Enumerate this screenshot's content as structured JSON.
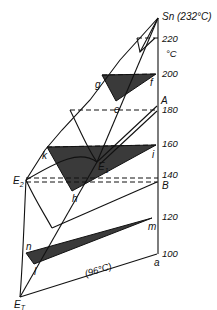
{
  "diagram": {
    "apex_label": "Sn (232°C)",
    "unit_label": "°C",
    "eutectic_temp_label": "(96°C)",
    "colors": {
      "line": "#111111",
      "shade": "#3a3a3a",
      "background": "#ffffff"
    },
    "axis_ticks": [
      {
        "label": "220",
        "value": 220
      },
      {
        "label": "200",
        "value": 200
      },
      {
        "label": "180",
        "value": 180
      },
      {
        "label": "160",
        "value": 160
      },
      {
        "label": "140",
        "value": 140
      },
      {
        "label": "120",
        "value": 120
      },
      {
        "label": "100",
        "value": 100
      }
    ],
    "points": {
      "A": "A",
      "B": "B",
      "a": "a",
      "g": "g",
      "f": "f",
      "e": "e",
      "k": "k",
      "i": "i",
      "E1": "E",
      "E1_sub": "1",
      "h": "h",
      "E2": "E",
      "E2_sub": "2",
      "n": "n",
      "l": "l",
      "m": "m",
      "ET": "E",
      "ET_sub": "T"
    },
    "tie_triangles": [
      {
        "name": "g-e-f",
        "temperature": 200
      },
      {
        "name": "k-h-i",
        "temperature": 160
      },
      {
        "name": "n-l-m",
        "temperature": 120
      }
    ]
  }
}
